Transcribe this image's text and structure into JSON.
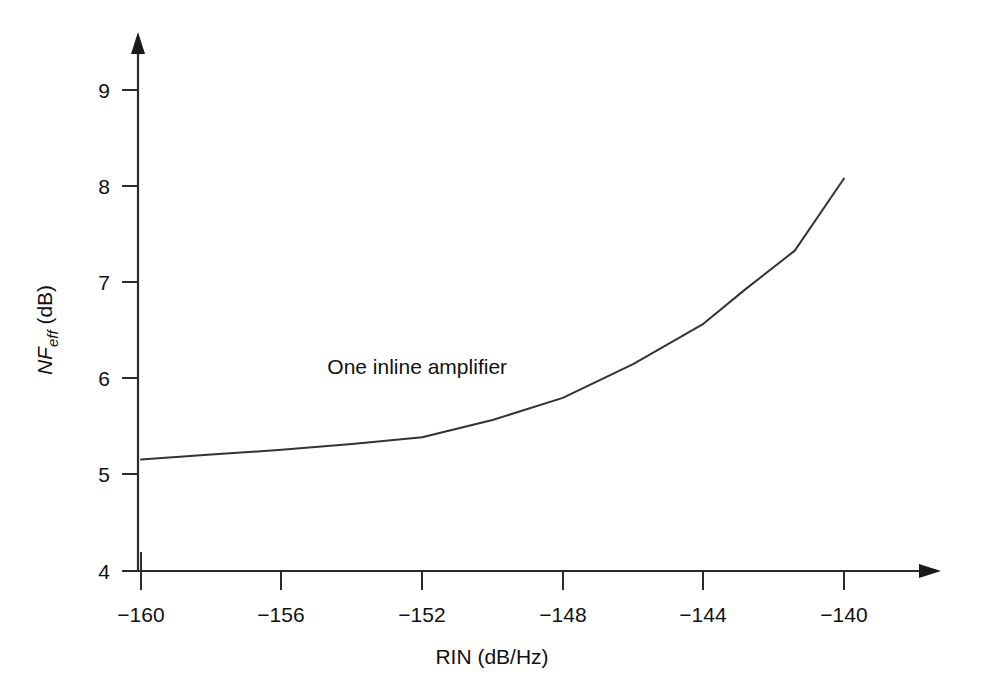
{
  "chart_data": {
    "type": "line",
    "title": "",
    "xlabel": "RIN (dB/Hz)",
    "ylabel_main": "NF",
    "ylabel_sub": "eff",
    "ylabel_unit": " (dB)",
    "ylabel_full": "NFeff (dB)",
    "xlim": [
      -161.0,
      -139.0
    ],
    "ylim": [
      4,
      9.4
    ],
    "xticks": [
      -160,
      -156,
      -152,
      -148,
      -144,
      -140
    ],
    "xtick_labels": [
      "−160",
      "−156",
      "−152",
      "−148",
      "−144",
      "−140"
    ],
    "yticks": [
      4,
      5,
      6,
      7,
      8,
      9
    ],
    "ytick_labels": [
      "4",
      "5",
      "6",
      "7",
      "8",
      "9"
    ],
    "grid": false,
    "legend": null,
    "annotations": [
      {
        "text": "One inline amplifier",
        "x": -154.7,
        "y": 6.05
      }
    ],
    "series": [
      {
        "name": "One inline amplifier",
        "x": [
          -160.0,
          -158.0,
          -156.0,
          -154.0,
          -152.0,
          -150.0,
          -148.0,
          -146.0,
          -144.0,
          -142.8,
          -141.4,
          -140.0
        ],
        "values": [
          5.16,
          5.21,
          5.26,
          5.32,
          5.39,
          5.57,
          5.8,
          6.15,
          6.57,
          6.93,
          7.33,
          8.08
        ]
      }
    ]
  },
  "axes": {
    "x_arrow": true,
    "y_arrow": true,
    "line_color": "#2b2b2b"
  }
}
